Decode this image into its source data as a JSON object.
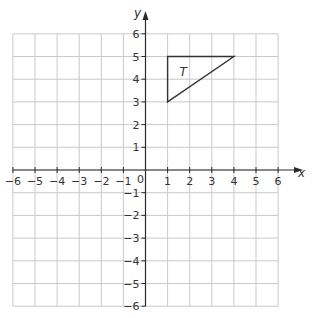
{
  "diagram": {
    "type": "coordinate-grid",
    "x_axis": {
      "label": "x",
      "min": -6,
      "max": 6,
      "ticks": [
        -6,
        -5,
        -4,
        -3,
        -2,
        -1,
        1,
        2,
        3,
        4,
        5,
        6
      ]
    },
    "y_axis": {
      "label": "y",
      "min": -6,
      "max": 6,
      "ticks": [
        -6,
        -5,
        -4,
        -3,
        -2,
        -1,
        1,
        2,
        3,
        4,
        5,
        6
      ]
    },
    "origin_label": "0",
    "shapes": [
      {
        "name": "T",
        "type": "triangle",
        "vertices": [
          [
            1,
            5
          ],
          [
            4,
            5
          ],
          [
            1,
            3
          ]
        ],
        "label_position": [
          1.7,
          4.3
        ]
      }
    ],
    "colors": {
      "grid": "#c9c9c9",
      "axis": "#2a2a2a",
      "shape": "#333333",
      "text": "#333333"
    }
  }
}
